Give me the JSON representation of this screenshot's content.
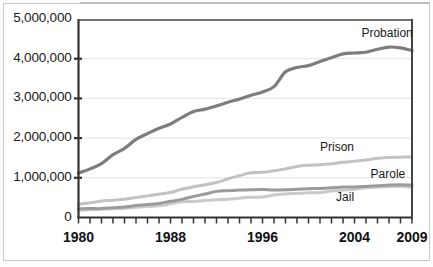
{
  "chart_data": {
    "type": "line",
    "title": "",
    "subtitle": "",
    "xlabel": "",
    "ylabel": "",
    "xlim": [
      1980,
      2009
    ],
    "ylim": [
      0,
      5000000
    ],
    "grid": true,
    "legend_position": "inline-right",
    "y_ticks": [
      0,
      1000000,
      2000000,
      3000000,
      4000000,
      5000000
    ],
    "y_tick_labels": [
      "0",
      "1,000,000",
      "2,000,000",
      "3,000,000",
      "4,000,000",
      "5,000,000"
    ],
    "x_ticks": [
      1980,
      1981,
      1982,
      1983,
      1984,
      1985,
      1986,
      1987,
      1988,
      1989,
      1990,
      1991,
      1992,
      1993,
      1994,
      1995,
      1996,
      1997,
      1998,
      1999,
      2000,
      2001,
      2002,
      2003,
      2004,
      2005,
      2006,
      2007,
      2008,
      2009
    ],
    "x_tick_labels": [
      "1980",
      "1988",
      "1996",
      "2004",
      "2009"
    ],
    "x_tick_label_years": [
      1980,
      1988,
      1996,
      2004,
      2009
    ],
    "x": [
      1980,
      1981,
      1982,
      1983,
      1984,
      1985,
      1986,
      1987,
      1988,
      1989,
      1990,
      1991,
      1992,
      1993,
      1994,
      1995,
      1996,
      1997,
      1998,
      1999,
      2000,
      2001,
      2002,
      2003,
      2004,
      2005,
      2006,
      2007,
      2008,
      2009
    ],
    "series": [
      {
        "name": "Probation",
        "color": "#7d7d7d",
        "width": 3.2,
        "label_x": 2004.6,
        "label_y": 4620000,
        "values": [
          1118000,
          1225000,
          1357000,
          1582000,
          1740000,
          1968000,
          2114000,
          2247000,
          2356000,
          2522000,
          2670000,
          2729000,
          2811000,
          2903000,
          2981000,
          3078000,
          3164000,
          3297000,
          3671000,
          3779000,
          3826000,
          3932000,
          4024000,
          4120000,
          4143000,
          4162000,
          4237000,
          4293000,
          4271000,
          4203000
        ]
      },
      {
        "name": "Prison",
        "color": "#c2c2c2",
        "width": 3.0,
        "label_x": 2001.0,
        "label_y": 1760000,
        "values": [
          330000,
          369000,
          414000,
          437000,
          462000,
          503000,
          545000,
          585000,
          628000,
          713000,
          774000,
          825000,
          883000,
          971000,
          1054000,
          1125000,
          1138000,
          1176000,
          1225000,
          1287000,
          1316000,
          1330000,
          1355000,
          1390000,
          1420000,
          1448000,
          1492000,
          1512000,
          1519000,
          1524000
        ]
      },
      {
        "name": "Parole",
        "color": "#9b9b9b",
        "width": 3.0,
        "label_x": 2005.4,
        "label_y": 1060000,
        "values": [
          220000,
          225000,
          224000,
          246000,
          266000,
          300000,
          325000,
          355000,
          407000,
          456000,
          531000,
          590000,
          658000,
          676000,
          690000,
          700000,
          705000,
          695000,
          697000,
          713000,
          724000,
          733000,
          750000,
          769000,
          771000,
          784000,
          799000,
          821000,
          828000,
          820000
        ]
      },
      {
        "name": "Jail",
        "color": "#cacaca",
        "width": 3.0,
        "label_x": 2002.4,
        "label_y": 490000,
        "values": [
          182000,
          196000,
          209000,
          223000,
          234000,
          256000,
          274000,
          295000,
          343000,
          395000,
          405000,
          426000,
          445000,
          459000,
          486000,
          507000,
          518000,
          567000,
          592000,
          606000,
          621000,
          631000,
          665000,
          691000,
          714000,
          747000,
          766000,
          780000,
          785000,
          760000
        ]
      }
    ]
  }
}
